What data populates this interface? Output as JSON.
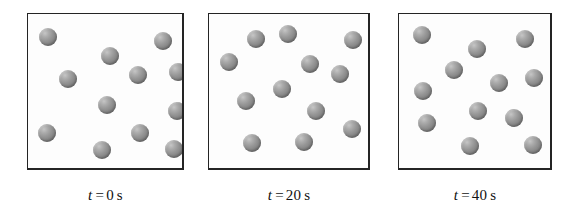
{
  "figure": {
    "type": "particle-diagram",
    "panel_count": 3,
    "particles_per_panel": 12,
    "particle_diameter_px": 18,
    "colors": {
      "box_border": "#242424",
      "box_fill": "#fdfdfd",
      "particle_base": "#949494",
      "particle_highlight": "#c6c6c6",
      "particle_shadow": "#6e6e6e",
      "caption_text": "#111111",
      "page_background": "#ffffff"
    },
    "panels": [
      {
        "id": "panel-t0",
        "box": {
          "x": 27,
          "y": 13,
          "width": 157,
          "height": 157
        },
        "caption": {
          "var": "t",
          "eq": "=",
          "val": "0",
          "unit": "s",
          "full": "t = 0 s"
        },
        "time_value": 0,
        "time_unit": "s",
        "particles": [
          {
            "x": 11,
            "y": 14
          },
          {
            "x": 73,
            "y": 33
          },
          {
            "x": 126,
            "y": 18
          },
          {
            "x": 31,
            "y": 56
          },
          {
            "x": 101,
            "y": 52
          },
          {
            "x": 141,
            "y": 49
          },
          {
            "x": 70,
            "y": 82
          },
          {
            "x": 140,
            "y": 88
          },
          {
            "x": 10,
            "y": 110
          },
          {
            "x": 103,
            "y": 110
          },
          {
            "x": 65,
            "y": 127
          },
          {
            "x": 137,
            "y": 126
          }
        ]
      },
      {
        "id": "panel-t20",
        "box": {
          "x": 208,
          "y": 13,
          "width": 162,
          "height": 157
        },
        "caption": {
          "var": "t",
          "eq": "=",
          "val": "20",
          "unit": "s",
          "full": "t = 20 s"
        },
        "time_value": 20,
        "time_unit": "s",
        "particles": [
          {
            "x": 38,
            "y": 16
          },
          {
            "x": 70,
            "y": 11
          },
          {
            "x": 135,
            "y": 17
          },
          {
            "x": 11,
            "y": 39
          },
          {
            "x": 92,
            "y": 41
          },
          {
            "x": 122,
            "y": 51
          },
          {
            "x": 64,
            "y": 66
          },
          {
            "x": 28,
            "y": 78
          },
          {
            "x": 98,
            "y": 88
          },
          {
            "x": 134,
            "y": 106
          },
          {
            "x": 34,
            "y": 120
          },
          {
            "x": 86,
            "y": 119
          }
        ]
      },
      {
        "id": "panel-t40",
        "box": {
          "x": 398,
          "y": 13,
          "width": 154,
          "height": 157
        },
        "caption": {
          "var": "t",
          "eq": "=",
          "val": "40",
          "unit": "s",
          "full": "t = 40 s"
        },
        "time_value": 40,
        "time_unit": "s",
        "particles": [
          {
            "x": 14,
            "y": 12
          },
          {
            "x": 69,
            "y": 26
          },
          {
            "x": 117,
            "y": 16
          },
          {
            "x": 46,
            "y": 47
          },
          {
            "x": 91,
            "y": 60
          },
          {
            "x": 126,
            "y": 55
          },
          {
            "x": 15,
            "y": 68
          },
          {
            "x": 70,
            "y": 88
          },
          {
            "x": 19,
            "y": 100
          },
          {
            "x": 106,
            "y": 95
          },
          {
            "x": 62,
            "y": 123
          },
          {
            "x": 125,
            "y": 122
          }
        ]
      }
    ]
  }
}
